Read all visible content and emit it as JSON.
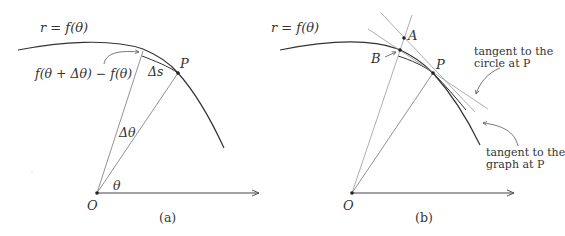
{
  "panel_a": {
    "curve_label": "r = f(θ)",
    "difference_label": "f(θ + Δθ) − f(θ)",
    "arc_label": "Δs",
    "point_label": "P",
    "angle_small_label": "Δθ",
    "angle_label": "θ",
    "origin_label": "O",
    "caption": "(a)"
  },
  "panel_b": {
    "curve_label": "r = f(θ)",
    "point_a_label": "A",
    "point_b_label": "B",
    "point_label": "P",
    "origin_label": "O",
    "circle_tangent_annotation": [
      "tangent to the",
      "circle at P"
    ],
    "graph_tangent_annotation": [
      "tangent to the",
      "graph at P"
    ],
    "caption": "(b)"
  },
  "colors": {
    "ink": "#333333",
    "thin_line": "#8a8a8a",
    "background": "#ffffff"
  }
}
